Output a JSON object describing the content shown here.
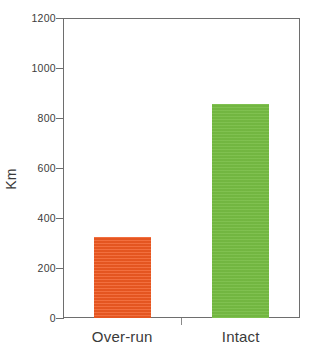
{
  "chart_data": {
    "type": "bar",
    "title": "",
    "subtitle": "",
    "xlabel": "",
    "ylabel": "Km",
    "categories": [
      "Over-run",
      "Intact"
    ],
    "values": [
      325,
      855
    ],
    "series": [
      {
        "name": "Km",
        "values": [
          325,
          855
        ],
        "colors": [
          "#f05a22",
          "#76bc43"
        ]
      }
    ],
    "ylim": [
      0,
      1200
    ],
    "ytick_values": [
      0,
      200,
      400,
      600,
      800,
      1000,
      1200
    ],
    "ytick_labels": [
      "0",
      "200",
      "400",
      "600",
      "800",
      "1000",
      "1200"
    ],
    "grid": false,
    "legend": null,
    "legend_position": "none",
    "frame": true,
    "bar_colors": {
      "over_run": "#f05a22",
      "intact": "#76bc43"
    },
    "axis_color": "#6e6e6e",
    "text_color": "#3a3a3a",
    "background": "#ffffff",
    "annotations": []
  }
}
